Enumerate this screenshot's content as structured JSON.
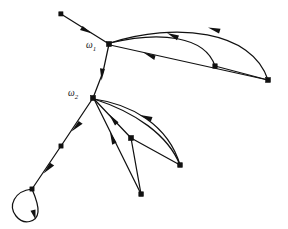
{
  "figure": {
    "background_color": "#ffffff",
    "stroke_color": "#111111",
    "labels": [
      {
        "id": "w1",
        "text": "ω",
        "subscript": "1",
        "x": 86,
        "y": 48
      },
      {
        "id": "w2",
        "text": "ω",
        "subscript": "2",
        "x": 68,
        "y": 96
      }
    ],
    "nodes": [
      {
        "id": "n0",
        "name": "top-left-leaf",
        "x": 61,
        "y": 14
      },
      {
        "id": "w1",
        "name": "omega-1-vertex",
        "x": 109,
        "y": 44
      },
      {
        "id": "w2",
        "name": "omega-2-vertex",
        "x": 93,
        "y": 98
      },
      {
        "id": "nR",
        "name": "far-right-vertex",
        "x": 268,
        "y": 80
      },
      {
        "id": "nM",
        "name": "mid-right-vertex",
        "x": 215,
        "y": 66
      },
      {
        "id": "nA",
        "name": "lower-mid-vertex",
        "x": 131,
        "y": 138
      },
      {
        "id": "nB",
        "name": "lower-right-vertex",
        "x": 180,
        "y": 165
      },
      {
        "id": "nC",
        "name": "bottom-vertex",
        "x": 141,
        "y": 194
      },
      {
        "id": "nD",
        "name": "left-chain-vertex",
        "x": 61,
        "y": 146
      },
      {
        "id": "nE",
        "name": "self-loop-vertex",
        "x": 32,
        "y": 189
      }
    ],
    "edges": [
      {
        "id": "e1",
        "name": "edge-leaf-to-omega1",
        "from": "n0",
        "to": "w1",
        "shape": "straight",
        "direction": "to"
      },
      {
        "id": "e2",
        "name": "edge-omega1-to-omega2",
        "from": "w1",
        "to": "w2",
        "shape": "straight",
        "direction": "to"
      },
      {
        "id": "e3",
        "name": "edge-far-right-arc-upper",
        "from": "nR",
        "to": "w1",
        "shape": "arc-up",
        "direction": "to"
      },
      {
        "id": "e4",
        "name": "edge-mid-right-arc",
        "from": "nM",
        "to": "w1",
        "shape": "arc-up",
        "direction": "to"
      },
      {
        "id": "e5",
        "name": "edge-far-right-straight",
        "from": "nR",
        "to": "w1",
        "shape": "straight",
        "direction": "to"
      },
      {
        "id": "e6",
        "name": "edge-mid-to-far-right",
        "from": "nM",
        "to": "nR",
        "shape": "straight",
        "direction": "none"
      },
      {
        "id": "e7",
        "name": "edge-lower-right-arc",
        "from": "nB",
        "to": "w2",
        "shape": "arc-up",
        "direction": "to"
      },
      {
        "id": "e8",
        "name": "edge-lower-right-arc-back",
        "from": "w2",
        "to": "nB",
        "shape": "arc-down",
        "direction": "none"
      },
      {
        "id": "e9",
        "name": "edge-lower-mid-to-omega2",
        "from": "nA",
        "to": "w2",
        "shape": "straight",
        "direction": "to"
      },
      {
        "id": "e10",
        "name": "edge-lower-mid-to-lowright",
        "from": "nA",
        "to": "nB",
        "shape": "straight",
        "direction": "none"
      },
      {
        "id": "e11",
        "name": "edge-lower-mid-to-bottom",
        "from": "nA",
        "to": "nC",
        "shape": "straight",
        "direction": "none"
      },
      {
        "id": "e12",
        "name": "edge-bottom-to-omega2",
        "from": "nC",
        "to": "w2",
        "shape": "straight",
        "direction": "to"
      },
      {
        "id": "e13",
        "name": "edge-omega2-to-left-chain",
        "from": "w2",
        "to": "nD",
        "shape": "straight",
        "direction": "to"
      },
      {
        "id": "e14",
        "name": "edge-left-chain-to-loop",
        "from": "nD",
        "to": "nE",
        "shape": "straight",
        "direction": "to"
      },
      {
        "id": "e15",
        "name": "self-loop-edge",
        "from": "nE",
        "to": "nE",
        "shape": "loop",
        "direction": "to"
      }
    ],
    "node_radius": 2.2,
    "edge_count": 15,
    "node_count": 10
  }
}
